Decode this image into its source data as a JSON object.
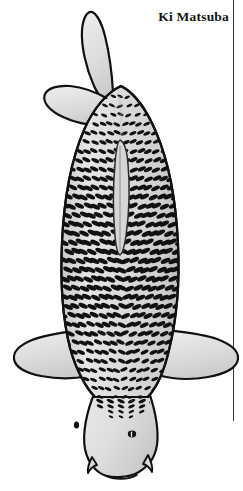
{
  "page": {
    "background_color": "#ffffff",
    "width": 243,
    "height": 491
  },
  "header": {
    "title": "Ki Matsuba"
  },
  "divider": {
    "name": "right-vertical-rule",
    "color": "#333333"
  },
  "illustration": {
    "name": "koi-fish-top-view",
    "subject": "Ki Matsuba koi",
    "view": "dorsal (top-down)",
    "orientation": "head at bottom, tail at top",
    "colors": {
      "outline": "#111111",
      "body_fill": "#d9d9d9",
      "body_highlight": "#ededed",
      "fin_fill": "#e2e2e2",
      "head_fill": "#e0e0e0",
      "scale_mark": "#111111",
      "dorsal_stripe": "#d2d2d2"
    },
    "parts": [
      {
        "name": "caudal-fin-upper-lobe",
        "label": "Upper tail lobe"
      },
      {
        "name": "caudal-fin-lower-lobe",
        "label": "Lower tail lobe"
      },
      {
        "name": "caudal-peduncle",
        "label": "Tail base"
      },
      {
        "name": "body",
        "label": "Body with matsuba scale reticulation"
      },
      {
        "name": "dorsal-fin",
        "label": "Dorsal fin"
      },
      {
        "name": "pectoral-fin-left",
        "label": "Left pectoral fin"
      },
      {
        "name": "pectoral-fin-right",
        "label": "Right pectoral fin"
      },
      {
        "name": "head",
        "label": "Head"
      },
      {
        "name": "eye-left",
        "label": "Left eye"
      },
      {
        "name": "eye-right",
        "label": "Right eye"
      },
      {
        "name": "barbel-left",
        "label": "Left barbel"
      },
      {
        "name": "barbel-right",
        "label": "Right barbel"
      },
      {
        "name": "mouth",
        "label": "Mouth"
      }
    ],
    "pattern": {
      "name": "matsuba-reticulation",
      "description": "Dark elliptical scale markings in a diagonal net pattern",
      "rows": 34,
      "columns": 15
    }
  }
}
